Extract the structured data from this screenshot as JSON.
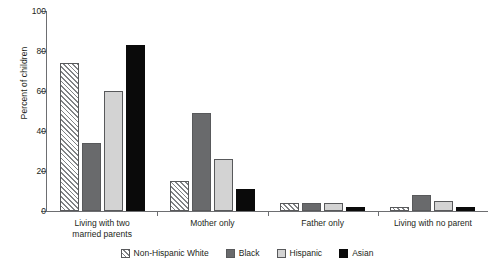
{
  "chart_data": {
    "type": "bar",
    "title": "",
    "subtitle": "",
    "xlabel": "",
    "ylabel": "Percent of children",
    "ylim": [
      0,
      100
    ],
    "yticks": [
      0,
      20,
      40,
      60,
      80,
      100
    ],
    "ytick_labels": [
      "0",
      "20",
      "40",
      "60",
      "80",
      "100"
    ],
    "grid": false,
    "legend_position": "bottom",
    "categories": [
      "Living with two married parents",
      "Mother only",
      "Father only",
      "Living with no parent"
    ],
    "category_lines": [
      [
        "Living with two",
        "married parents"
      ],
      [
        "Mother only"
      ],
      [
        "Father only"
      ],
      [
        "Living with no parent"
      ]
    ],
    "series": [
      {
        "name": "Non-Hispanic White",
        "pattern": "diagonal-hatch",
        "color": "#ffffff",
        "values": [
          74,
          15,
          4,
          2
        ]
      },
      {
        "name": "Black",
        "pattern": "solid",
        "color": "#696a6c",
        "values": [
          34,
          49,
          4,
          8
        ]
      },
      {
        "name": "Hispanic",
        "pattern": "solid",
        "color": "#d3d3d3",
        "values": [
          60,
          26,
          4,
          5
        ]
      },
      {
        "name": "Asian",
        "pattern": "solid",
        "color": "#0a0a0a",
        "values": [
          83,
          11,
          2,
          2
        ]
      }
    ]
  },
  "axis": {
    "y_title": "Percent of children"
  },
  "legend": {
    "items": [
      {
        "label": "Non-Hispanic White"
      },
      {
        "label": "Black"
      },
      {
        "label": "Hispanic"
      },
      {
        "label": "Asian"
      }
    ]
  },
  "colors": {
    "axis": "#6d6e71",
    "text": "#231f20",
    "series_black": "#696a6c",
    "series_light": "#d3d3d3",
    "series_dark": "#0a0a0a",
    "background": "#ffffff"
  }
}
